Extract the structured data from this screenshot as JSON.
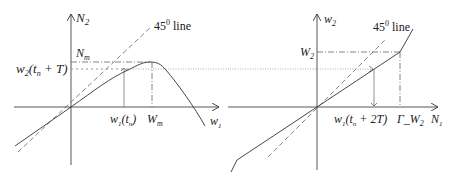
{
  "left_plot": {
    "y_axis_label": "N",
    "y_axis_sub": "2",
    "x_axis_label": "w",
    "x_axis_sub": "1",
    "line_45_label": "45",
    "line_45_sup": "0",
    "line_45_word": " line",
    "nm_label": "N",
    "nm_sub": "m",
    "w2_label": "w",
    "w2_sub": "2",
    "w2_arg": "(t",
    "w2_arg_sub": "n",
    "w2_arg_tail": " + T)",
    "w1_label": "w",
    "w1_sub": "1",
    "w1_arg": "(t",
    "w1_arg_sub": "n",
    "w1_arg_tail": ")",
    "wm_label": "W",
    "wm_sub": "m"
  },
  "right_plot": {
    "y_axis_label": "w",
    "y_axis_sub": "2",
    "x_axis_label": "N",
    "x_axis_sub": "1",
    "line_45_label": "45",
    "line_45_sup": "0",
    "line_45_word": " line",
    "w2_cap_label": "W",
    "w2_cap_sub": "2",
    "w1_label": "w",
    "w1_sub": "1",
    "w1_arg": "(t",
    "w1_arg_sub": "n",
    "w1_arg_tail": " + 2T)",
    "gamma_label": "Γ_W",
    "gamma_sub": "2"
  }
}
